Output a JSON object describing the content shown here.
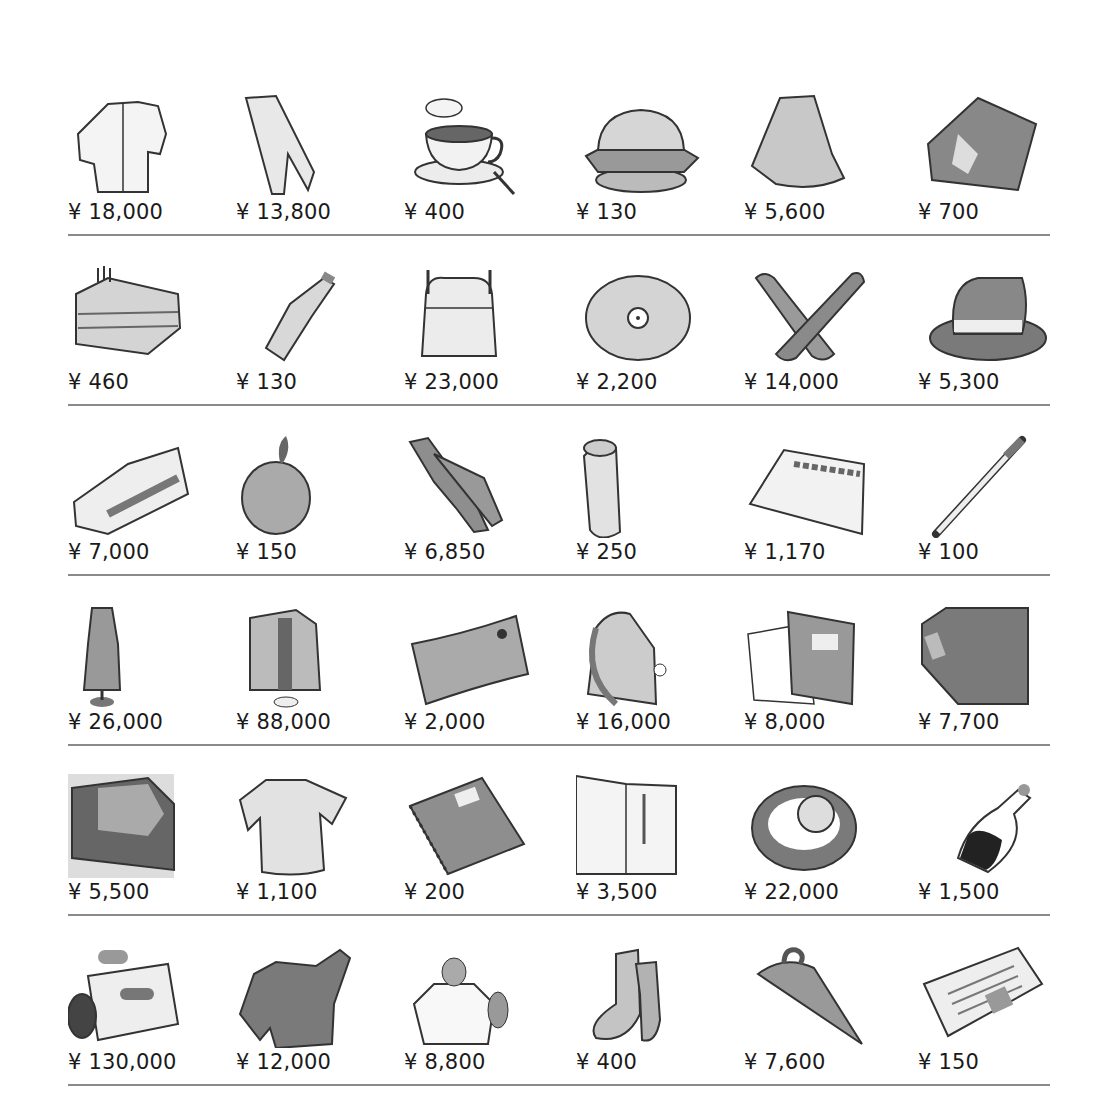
{
  "currency_symbol": "¥",
  "rows": [
    {
      "items": [
        {
          "name": "shirt",
          "price": "¥ 18,000"
        },
        {
          "name": "pants",
          "price": "¥ 13,800"
        },
        {
          "name": "coffee",
          "price": "¥ 400"
        },
        {
          "name": "hamburger",
          "price": "¥ 130"
        },
        {
          "name": "skirt",
          "price": "¥ 5,600"
        },
        {
          "name": "book",
          "price": "¥ 700"
        }
      ]
    },
    {
      "items": [
        {
          "name": "cake",
          "price": "¥ 460"
        },
        {
          "name": "cola-bottle",
          "price": "¥ 130"
        },
        {
          "name": "backpack",
          "price": "¥ 23,000"
        },
        {
          "name": "cd",
          "price": "¥ 2,200"
        },
        {
          "name": "shoes",
          "price": "¥ 14,000"
        },
        {
          "name": "hat",
          "price": "¥ 5,300"
        }
      ]
    },
    {
      "items": [
        {
          "name": "sneakers",
          "price": "¥ 7,000"
        },
        {
          "name": "apple",
          "price": "¥ 150"
        },
        {
          "name": "jeans",
          "price": "¥ 6,850"
        },
        {
          "name": "soda-can",
          "price": "¥ 250"
        },
        {
          "name": "handkerchief",
          "price": "¥ 1,170"
        },
        {
          "name": "pen",
          "price": "¥ 100"
        }
      ]
    },
    {
      "items": [
        {
          "name": "dress",
          "price": "¥ 26,000"
        },
        {
          "name": "suit",
          "price": "¥ 88,000"
        },
        {
          "name": "movie-ticket",
          "price": "¥ 2,000"
        },
        {
          "name": "bag",
          "price": "¥ 16,000"
        },
        {
          "name": "stationery",
          "price": "¥ 8,000"
        },
        {
          "name": "dictionary",
          "price": "¥ 7,700"
        }
      ]
    },
    {
      "items": [
        {
          "name": "video-tape",
          "price": "¥ 5,500"
        },
        {
          "name": "t-shirt",
          "price": "¥ 1,100"
        },
        {
          "name": "notebook",
          "price": "¥ 200"
        },
        {
          "name": "magazine",
          "price": "¥ 3,500"
        },
        {
          "name": "watch",
          "price": "¥ 22,000"
        },
        {
          "name": "wine-bottle",
          "price": "¥ 1,500"
        }
      ]
    },
    {
      "items": [
        {
          "name": "video-camera",
          "price": "¥ 130,000"
        },
        {
          "name": "sweater",
          "price": "¥ 12,000"
        },
        {
          "name": "perfume",
          "price": "¥ 8,800"
        },
        {
          "name": "socks",
          "price": "¥ 400"
        },
        {
          "name": "umbrella",
          "price": "¥ 7,600"
        },
        {
          "name": "newspaper",
          "price": "¥ 150"
        }
      ]
    }
  ],
  "colors": {
    "text": "#1a1a1a",
    "divider": "#8a8a8a",
    "ink": "#333333",
    "fill_light": "#e6e6e6",
    "fill_mid": "#b8b8b8",
    "fill_dark": "#7a7a7a"
  }
}
